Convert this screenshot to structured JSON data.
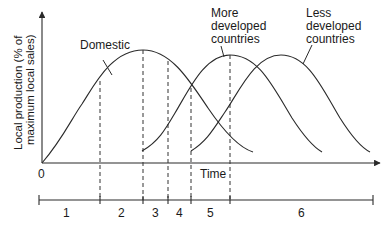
{
  "diagram": {
    "type": "product life cycle / international production diagram",
    "y_axis_label_line1": "Local production (% of",
    "y_axis_label_line2": "maximum local sales)",
    "x_axis_label": "Time",
    "origin_label": "0",
    "curves": [
      {
        "name": "Domestic",
        "label": "Domestic"
      },
      {
        "name": "More developed countries",
        "label_lines": [
          "More",
          "developed",
          "countries"
        ]
      },
      {
        "name": "Less developed countries",
        "label_lines": [
          "Less",
          "developed",
          "countries"
        ]
      }
    ],
    "stages": [
      {
        "label": "1"
      },
      {
        "label": "2"
      },
      {
        "label": "3"
      },
      {
        "label": "4"
      },
      {
        "label": "5"
      },
      {
        "label": "6"
      }
    ]
  }
}
